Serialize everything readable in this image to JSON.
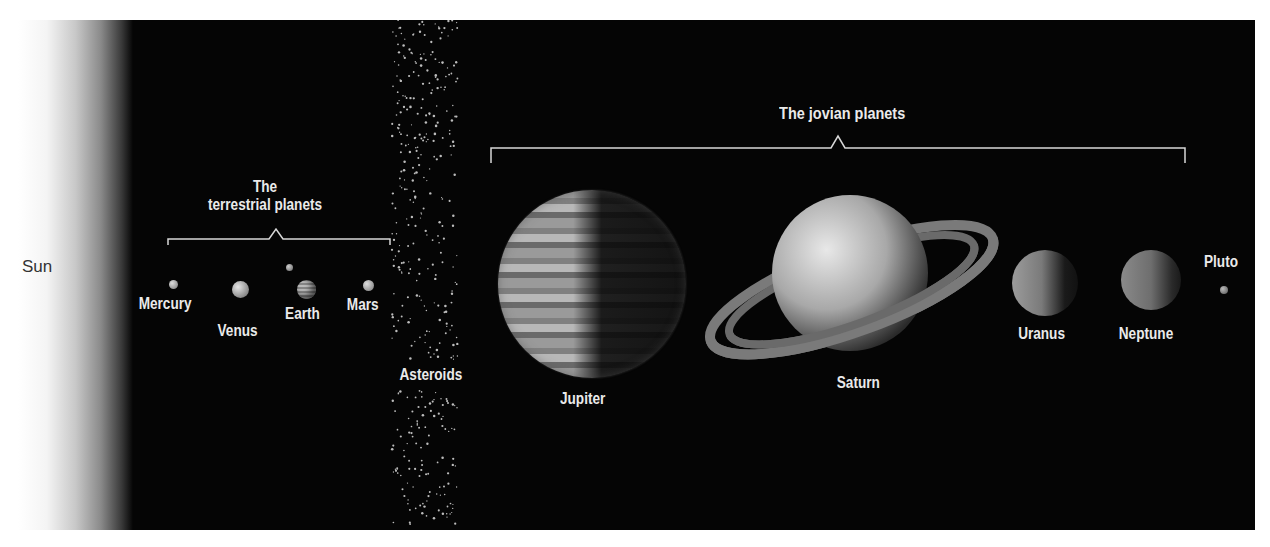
{
  "sun": {
    "label": "Sun"
  },
  "groups": {
    "terrestrial": {
      "title_line1": "The",
      "title_line2": "terrestrial planets"
    },
    "jovian": {
      "title": "The jovian planets"
    }
  },
  "belt": {
    "label": "Asteroids"
  },
  "planets": {
    "mercury": {
      "label": "Mercury"
    },
    "venus": {
      "label": "Venus"
    },
    "earth": {
      "label": "Earth"
    },
    "mars": {
      "label": "Mars"
    },
    "jupiter": {
      "label": "Jupiter"
    },
    "saturn": {
      "label": "Saturn"
    },
    "uranus": {
      "label": "Uranus"
    },
    "neptune": {
      "label": "Neptune"
    },
    "pluto": {
      "label": "Pluto"
    }
  },
  "colors": {
    "background": "#050505",
    "label": "#eaeaea",
    "bracket": "#d8d8d8"
  }
}
